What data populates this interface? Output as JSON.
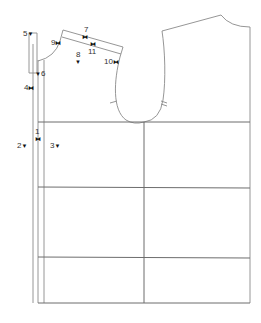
{
  "diagram": {
    "type": "garment sewing pattern",
    "line_color": "#8a8a8a",
    "markers": [
      {
        "id": "1",
        "label": "1",
        "symbol": "bowtie"
      },
      {
        "id": "2",
        "label": "2",
        "symbol": "triangle-down"
      },
      {
        "id": "3",
        "label": "3",
        "symbol": "triangle-down"
      },
      {
        "id": "4",
        "label": "4",
        "symbol": "bowtie"
      },
      {
        "id": "5",
        "label": "5",
        "symbol": "triangle-down"
      },
      {
        "id": "6",
        "label": "6",
        "symbol": "triangle-down"
      },
      {
        "id": "7",
        "label": "7",
        "symbol": "bowtie"
      },
      {
        "id": "8",
        "label": "8",
        "symbol": "triangle-down"
      },
      {
        "id": "9",
        "label": "9",
        "symbol": "bowtie"
      },
      {
        "id": "10",
        "label": "10",
        "symbol": "bowtie"
      },
      {
        "id": "11",
        "label": "11",
        "symbol": "bowtie"
      }
    ],
    "symbols": {
      "bowtie": "⧓",
      "triangle-down": "▼"
    }
  }
}
